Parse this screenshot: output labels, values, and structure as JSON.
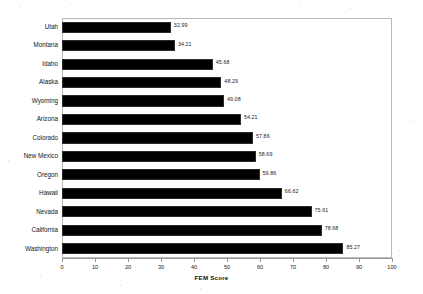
{
  "chart_data": {
    "type": "bar",
    "orientation": "horizontal",
    "title": "",
    "xlabel": "FEM Score",
    "ylabel": "",
    "xlim": [
      0,
      100
    ],
    "xticks": [
      0,
      10,
      20,
      30,
      40,
      50,
      60,
      70,
      80,
      90,
      100
    ],
    "grid": false,
    "legend": null,
    "bar_color": "#000000",
    "categories": [
      "Utah",
      "Montana",
      "Idaho",
      "Alaska",
      "Wyoming",
      "Arizona",
      "Colorado",
      "New Mexico",
      "Oregon",
      "Hawaii",
      "Nevada",
      "California",
      "Washington"
    ],
    "values": [
      32.99,
      34.21,
      45.68,
      48.29,
      49.08,
      54.21,
      57.86,
      58.69,
      59.86,
      66.62,
      75.61,
      78.68,
      85.27
    ],
    "value_labels": [
      "32.99",
      "34.21",
      "45.68",
      "48.29",
      "49.08",
      "54.21",
      "57.86",
      "58.69",
      "59.86",
      "66.62",
      "75.61",
      "78.68",
      "85.27"
    ]
  }
}
